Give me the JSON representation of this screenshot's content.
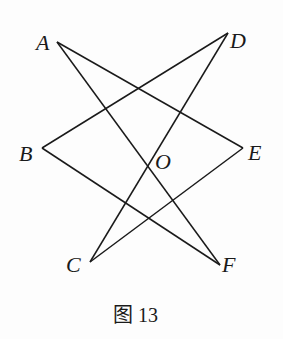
{
  "figure": {
    "caption": "图 13",
    "points": {
      "A": {
        "label": "A",
        "x": 57,
        "y": 42
      },
      "D": {
        "label": "D",
        "x": 228,
        "y": 33
      },
      "B": {
        "label": "B",
        "x": 42,
        "y": 148
      },
      "E": {
        "label": "E",
        "x": 243,
        "y": 148
      },
      "O": {
        "label": "O",
        "x": 150,
        "y": 167
      },
      "C": {
        "label": "C",
        "x": 90,
        "y": 262
      },
      "F": {
        "label": "F",
        "x": 220,
        "y": 265
      }
    },
    "segments": [
      [
        "A",
        "E"
      ],
      [
        "A",
        "F"
      ],
      [
        "D",
        "B"
      ],
      [
        "D",
        "C"
      ],
      [
        "B",
        "F"
      ],
      [
        "C",
        "E"
      ]
    ],
    "line_color": "#1a1a1a"
  }
}
